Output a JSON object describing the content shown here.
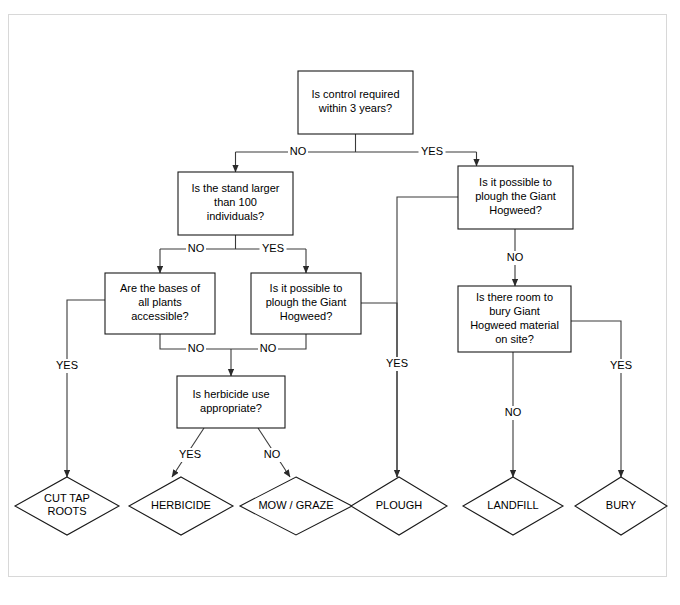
{
  "diagram": {
    "type": "flowchart",
    "background_color": "#ffffff",
    "border_color": "#d8d8d8",
    "line_color": "#3a3a3a",
    "shape_stroke_color": "#1a1a1a",
    "text_color": "#000000",
    "decisions": [
      {
        "id": "control-required",
        "lines": [
          "Is control required",
          "within 3 years?"
        ],
        "x": 298,
        "y": 71,
        "w": 115,
        "h": 63
      },
      {
        "id": "stand-larger",
        "lines": [
          "Is the stand larger",
          "than 100",
          "individuals?"
        ],
        "x": 178,
        "y": 172,
        "w": 115,
        "h": 63
      },
      {
        "id": "plough-right",
        "lines": [
          "Is it possible to",
          "plough the Giant",
          "Hogweed?"
        ],
        "x": 458,
        "y": 166,
        "w": 115,
        "h": 63
      },
      {
        "id": "bases-accessible",
        "lines": [
          "Are the bases of",
          "all plants",
          "accessible?"
        ],
        "x": 105,
        "y": 273,
        "w": 110,
        "h": 61
      },
      {
        "id": "plough-left",
        "lines": [
          "Is it possible to",
          "plough the Giant",
          "Hogweed?"
        ],
        "x": 251,
        "y": 273,
        "w": 110,
        "h": 61
      },
      {
        "id": "room-to-bury",
        "lines": [
          "Is there room to",
          "bury Giant",
          "Hogweed material",
          "on site?"
        ],
        "x": 458,
        "y": 286,
        "w": 113,
        "h": 66
      },
      {
        "id": "herbicide-appropriate",
        "lines": [
          "Is herbicide use",
          "appropriate?"
        ],
        "x": 177,
        "y": 376,
        "w": 108,
        "h": 52
      }
    ],
    "terminals": [
      {
        "id": "cut-tap-roots",
        "lines": [
          "CUT TAP",
          "ROOTS"
        ],
        "cx": 67,
        "cy": 506,
        "rx": 52,
        "ry": 29
      },
      {
        "id": "herbicide",
        "lines": [
          "HERBICIDE"
        ],
        "cx": 181,
        "cy": 506,
        "rx": 52,
        "ry": 29
      },
      {
        "id": "mow-graze",
        "lines": [
          "MOW / GRAZE"
        ],
        "cx": 296,
        "cy": 506,
        "rx": 56,
        "ry": 29
      },
      {
        "id": "plough",
        "lines": [
          "PLOUGH"
        ],
        "cx": 399,
        "cy": 506,
        "rx": 48,
        "ry": 29
      },
      {
        "id": "landfill",
        "lines": [
          "LANDFILL"
        ],
        "cx": 513,
        "cy": 506,
        "rx": 50,
        "ry": 29
      },
      {
        "id": "bury",
        "lines": [
          "BURY"
        ],
        "cx": 621,
        "cy": 506,
        "rx": 46,
        "ry": 29
      }
    ],
    "connectors": [
      {
        "id": "control-to-split",
        "from": "control-required",
        "to": "split-bus",
        "path": "M 355.5 134 L 355.5 152",
        "arrow": false
      },
      {
        "id": "split-bus-horizontal",
        "from": "control-required",
        "to": "branch-bus",
        "path": "M 235.5 152 L 476.5 152",
        "arrow": false
      },
      {
        "id": "no-to-stand",
        "label": "NO",
        "from": "control-required",
        "to": "stand-larger",
        "path": "M 235.5 152 L 235.5 172",
        "arrow": true
      },
      {
        "id": "yes-to-plough-right",
        "label": "YES",
        "from": "control-required",
        "to": "plough-right",
        "path": "M 476.5 152 L 476.5 166",
        "arrow": true
      },
      {
        "id": "stand-down",
        "from": "stand-larger",
        "to": "stand-bus",
        "path": "M 235.5 235 L 235.5 249",
        "arrow": false
      },
      {
        "id": "stand-bus",
        "from": "stand-larger",
        "to": "stand-branches",
        "path": "M 160 249 L 306 249",
        "arrow": false
      },
      {
        "id": "stand-no-to-bases",
        "label": "NO",
        "from": "stand-larger",
        "to": "bases-accessible",
        "path": "M 160 249 L 160 273",
        "arrow": true
      },
      {
        "id": "stand-yes-to-plough-left",
        "label": "YES",
        "from": "stand-larger",
        "to": "plough-left",
        "path": "M 306 249 L 306 273",
        "arrow": true
      },
      {
        "id": "bases-yes-to-cut",
        "label": "YES",
        "from": "bases-accessible",
        "to": "cut-tap-roots",
        "path": "M 105 300 L 67 300 L 67 477",
        "arrow": true
      },
      {
        "id": "bases-no-down",
        "label": "NO",
        "from": "bases-accessible",
        "to": "herbicide-junction",
        "path": "M 160 334 L 160 349 L 231 349",
        "arrow": false
      },
      {
        "id": "plough-left-no-down",
        "label": "NO",
        "from": "plough-left",
        "to": "herbicide-junction",
        "path": "M 306 334 L 306 349 L 231 349",
        "arrow": false
      },
      {
        "id": "herbicide-junction-down",
        "from": "herbicide-junction",
        "to": "herbicide-appropriate",
        "path": "M 231 349 L 231 376",
        "arrow": true
      },
      {
        "id": "plough-left-yes-to-plough",
        "label": "YES",
        "from": "plough-left",
        "to": "plough",
        "path": "M 361 303 L 397 303 L 397 477",
        "arrow": true
      },
      {
        "id": "plough-right-yes-to-plough",
        "label": "YES",
        "from": "plough-right",
        "to": "plough",
        "path": "M 458 197 L 397 197 L 397 477",
        "arrow": false
      },
      {
        "id": "plough-right-no-to-bury-q",
        "label": "NO",
        "from": "plough-right",
        "to": "room-to-bury",
        "path": "M 515 229 L 515 286",
        "arrow": true
      },
      {
        "id": "bury-q-no-to-landfill",
        "label": "NO",
        "from": "room-to-bury",
        "to": "landfill",
        "path": "M 513 352 L 513 477",
        "arrow": true
      },
      {
        "id": "bury-q-yes-to-bury",
        "label": "YES",
        "from": "room-to-bury",
        "to": "bury",
        "path": "M 571 321 L 621 321 L 621 477",
        "arrow": true
      },
      {
        "id": "herbicide-yes-to-herbicide",
        "label": "YES",
        "from": "herbicide-appropriate",
        "to": "herbicide",
        "path": "M 204 428 L 172 477",
        "arrow": true
      },
      {
        "id": "herbicide-no-to-mow",
        "label": "NO",
        "from": "herbicide-appropriate",
        "to": "mow-graze",
        "path": "M 258 428 L 290 477",
        "arrow": true
      }
    ],
    "edge_labels": [
      {
        "id": "label-control-no",
        "text": "NO",
        "x": 298,
        "y": 152
      },
      {
        "id": "label-control-yes",
        "text": "YES",
        "x": 432,
        "y": 152
      },
      {
        "id": "label-stand-no",
        "text": "NO",
        "x": 196,
        "y": 249
      },
      {
        "id": "label-stand-yes",
        "text": "YES",
        "x": 273,
        "y": 249
      },
      {
        "id": "label-bases-yes",
        "text": "YES",
        "x": 67,
        "y": 366
      },
      {
        "id": "label-bases-no",
        "text": "NO",
        "x": 196,
        "y": 349
      },
      {
        "id": "label-plough-left-no",
        "text": "NO",
        "x": 268,
        "y": 349
      },
      {
        "id": "label-plough-yes",
        "text": "YES",
        "x": 397,
        "y": 364
      },
      {
        "id": "label-plough-right-no",
        "text": "NO",
        "x": 515,
        "y": 258
      },
      {
        "id": "label-bury-no",
        "text": "NO",
        "x": 513,
        "y": 413
      },
      {
        "id": "label-bury-yes",
        "text": "YES",
        "x": 621,
        "y": 366
      },
      {
        "id": "label-herbicide-yes",
        "text": "YES",
        "x": 190,
        "y": 455
      },
      {
        "id": "label-herbicide-no",
        "text": "NO",
        "x": 272,
        "y": 455
      }
    ]
  }
}
